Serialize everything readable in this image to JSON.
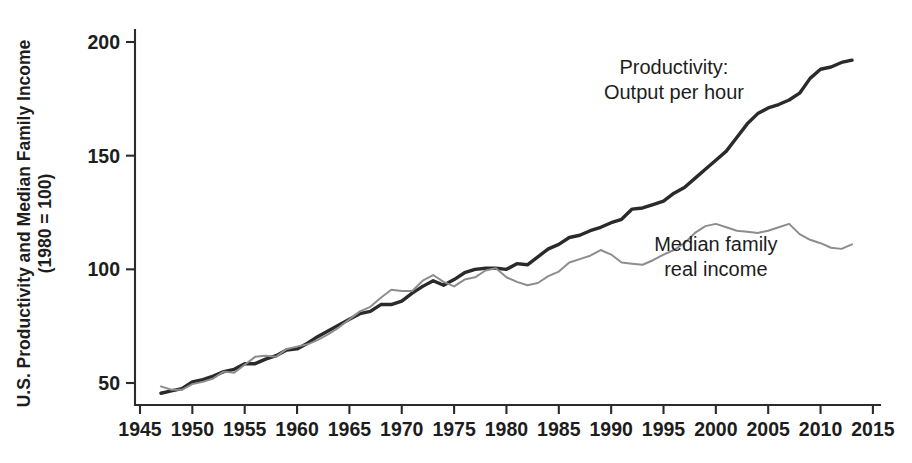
{
  "chart_data": {
    "type": "line",
    "title": "",
    "xlabel": "",
    "ylabel_line1": "U.S. Productivity and Median Family Income",
    "ylabel_line2": "(1980 = 100)",
    "xlim": [
      1945,
      2015
    ],
    "ylim": [
      40,
      205
    ],
    "grid": false,
    "legend_position": "inline-annotations",
    "xticks": [
      1945,
      1950,
      1955,
      1960,
      1965,
      1970,
      1975,
      1980,
      1985,
      1990,
      1995,
      2000,
      2005,
      2010,
      2015
    ],
    "xtick_labels": [
      "1945",
      "1950",
      "1955",
      "1960",
      "1965",
      "1970",
      "1975",
      "1980",
      "1985",
      "1990",
      "1995",
      "2000",
      "2005",
      "2010",
      "2015"
    ],
    "yticks": [
      50,
      100,
      150,
      200
    ],
    "ytick_labels": [
      "50",
      "100",
      "150",
      "200"
    ],
    "annotations": [
      {
        "id": "productivity-label",
        "line1": "Productivity:",
        "line2": "Output per hour",
        "x": 1996,
        "y": 186
      },
      {
        "id": "income-label",
        "line1": "Median family",
        "line2": "real income",
        "x": 2000,
        "y": 108
      }
    ],
    "series": [
      {
        "name": "Productivity: Output per hour",
        "color": "#2a2a2a",
        "width": 3.4,
        "x": [
          1947,
          1948,
          1949,
          1950,
          1951,
          1952,
          1953,
          1954,
          1955,
          1956,
          1957,
          1958,
          1959,
          1960,
          1961,
          1962,
          1963,
          1964,
          1965,
          1966,
          1967,
          1968,
          1969,
          1970,
          1971,
          1972,
          1973,
          1974,
          1975,
          1976,
          1977,
          1978,
          1979,
          1980,
          1981,
          1982,
          1983,
          1984,
          1985,
          1986,
          1987,
          1988,
          1989,
          1990,
          1991,
          1992,
          1993,
          1994,
          1995,
          1996,
          1997,
          1998,
          1999,
          2000,
          2001,
          2002,
          2003,
          2004,
          2005,
          2006,
          2007,
          2008,
          2009,
          2010,
          2011,
          2012,
          2013
        ],
        "values": [
          45.5,
          46.5,
          47.5,
          50.5,
          51.5,
          53.0,
          55.0,
          56.0,
          58.5,
          58.5,
          60.5,
          62.0,
          64.5,
          65.0,
          67.5,
          70.5,
          73.0,
          75.5,
          78.0,
          80.5,
          81.5,
          84.5,
          84.5,
          86.0,
          89.5,
          92.5,
          95.0,
          93.0,
          95.5,
          98.5,
          100.0,
          100.5,
          100.5,
          100.0,
          102.5,
          102.0,
          105.5,
          109.0,
          111.0,
          114.0,
          115.0,
          117.0,
          118.5,
          120.5,
          122.0,
          126.5,
          127.0,
          128.5,
          130.0,
          133.5,
          136.0,
          140.0,
          144.0,
          148.0,
          152.0,
          158.0,
          164.0,
          168.5,
          171.0,
          172.5,
          174.5,
          177.5,
          184.0,
          188.0,
          189.0,
          191.0,
          192.0
        ]
      },
      {
        "name": "Median family real income",
        "color": "#8d8d8d",
        "width": 2.0,
        "x": [
          1947,
          1948,
          1949,
          1950,
          1951,
          1952,
          1953,
          1954,
          1955,
          1956,
          1957,
          1958,
          1959,
          1960,
          1961,
          1962,
          1963,
          1964,
          1965,
          1966,
          1967,
          1968,
          1969,
          1970,
          1971,
          1972,
          1973,
          1974,
          1975,
          1976,
          1977,
          1978,
          1979,
          1980,
          1981,
          1982,
          1983,
          1984,
          1985,
          1986,
          1987,
          1988,
          1989,
          1990,
          1991,
          1992,
          1993,
          1994,
          1995,
          1996,
          1997,
          1998,
          1999,
          2000,
          2001,
          2002,
          2003,
          2004,
          2005,
          2006,
          2007,
          2008,
          2009,
          2010,
          2011,
          2012,
          2013
        ],
        "values": [
          48.5,
          47.0,
          47.0,
          49.5,
          50.5,
          52.0,
          55.0,
          54.5,
          58.0,
          61.5,
          62.0,
          61.5,
          65.0,
          66.0,
          67.0,
          69.0,
          71.5,
          74.5,
          78.0,
          81.5,
          83.5,
          87.5,
          91.0,
          90.5,
          90.5,
          95.0,
          97.5,
          94.5,
          92.5,
          95.5,
          96.5,
          99.5,
          100.5,
          96.5,
          94.5,
          93.0,
          94.0,
          97.0,
          99.0,
          103.0,
          104.5,
          106.0,
          108.5,
          106.5,
          103.0,
          102.5,
          102.0,
          104.0,
          106.5,
          108.5,
          111.5,
          116.0,
          119.0,
          120.0,
          118.5,
          117.0,
          116.5,
          116.0,
          117.0,
          118.5,
          120.0,
          115.5,
          113.0,
          111.5,
          109.5,
          109.0,
          111.0
        ]
      }
    ]
  }
}
